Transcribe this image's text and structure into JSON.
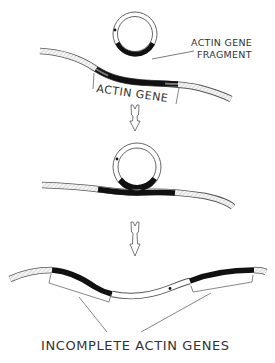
{
  "diagram": {
    "type": "process-flow",
    "colors": {
      "ink": "#1a1a1a",
      "outline": "#555555",
      "strand_fill": "#f2f2f2",
      "hatch": "#bdbdbd",
      "background": "#ffffff"
    },
    "steps": [
      {
        "id": "step-1",
        "elements": [
          "plasmid-circle",
          "chromosome-strand"
        ],
        "labels": {
          "fragment_line1": "ACTIN GENE",
          "fragment_line2": "FRAGMENT",
          "gene": "ACTIN GENE"
        }
      },
      {
        "id": "step-2",
        "elements": [
          "plasmid-circle-paired",
          "chromosome-strand"
        ],
        "labels": {}
      },
      {
        "id": "step-3",
        "elements": [
          "chromosome-strand-with-insert"
        ],
        "labels": {
          "result": "INCOMPLETE ACTIN GENES"
        }
      }
    ],
    "arrows": [
      {
        "from": "step-1",
        "to": "step-2",
        "direction": "down"
      },
      {
        "from": "step-2",
        "to": "step-3",
        "direction": "down"
      }
    ]
  }
}
